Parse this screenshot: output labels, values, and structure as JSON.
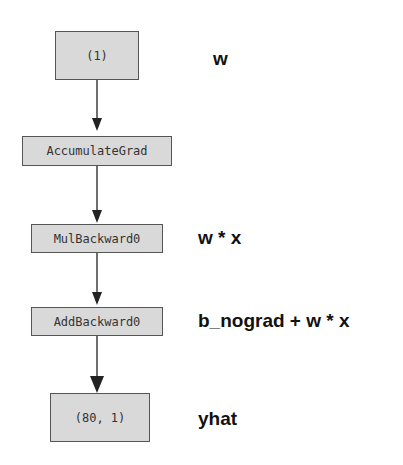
{
  "diagram": {
    "nodes": [
      {
        "id": "n1",
        "text": "(1)",
        "annotation": "w"
      },
      {
        "id": "n2",
        "text": "AccumulateGrad",
        "annotation": ""
      },
      {
        "id": "n3",
        "text": "MulBackward0",
        "annotation": "w * x"
      },
      {
        "id": "n4",
        "text": "AddBackward0",
        "annotation": "b_nograd + w * x"
      },
      {
        "id": "n5",
        "text": "(80, 1)",
        "annotation": "yhat"
      }
    ],
    "edges": [
      {
        "from": "n1",
        "to": "n2"
      },
      {
        "from": "n2",
        "to": "n3"
      },
      {
        "from": "n3",
        "to": "n4"
      },
      {
        "from": "n4",
        "to": "n5"
      }
    ],
    "colors": {
      "node_fill": "#d9d9d9",
      "node_border": "#555555",
      "edge": "#222222"
    }
  }
}
